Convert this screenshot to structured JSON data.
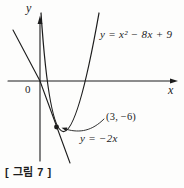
{
  "colors": {
    "ink": "#1c1c1c",
    "background": "#fdfdfc"
  },
  "graph": {
    "y_axis_label": "y",
    "x_axis_label": "x",
    "origin_label": "0",
    "parabola_equation": "y = x² − 8x + 9",
    "line_equation": "y = −2x",
    "tangent_point_label": "(3, −6)"
  },
  "caption": "[ 그림 7 ]"
}
